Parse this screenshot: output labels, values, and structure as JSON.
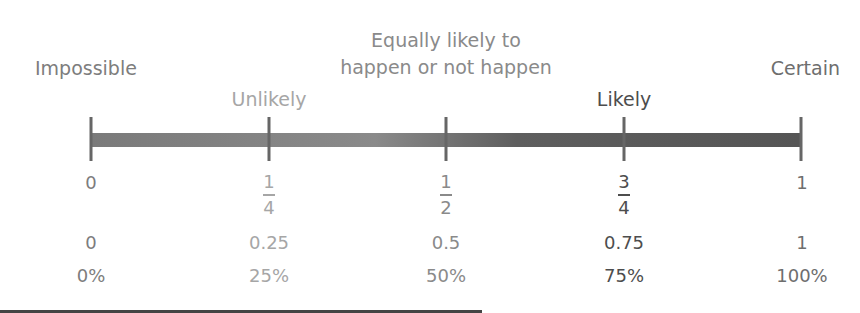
{
  "colors": {
    "impossible": "#7d7d7d",
    "unlikely": "#a6a6a6",
    "equal": "#8a8a8a",
    "likely": "#4d4d4d",
    "certain": "#6e6e6e"
  },
  "labels": {
    "impossible": "Impossible",
    "equal_line1": "Equally likely to",
    "equal_line2": "happen or not happen",
    "certain": "Certain",
    "unlikely": "Unlikely",
    "likely": "Likely"
  },
  "scale": {
    "points": [
      {
        "fraction_num": "0",
        "fraction_den": "",
        "decimal": "0",
        "percent": "0%"
      },
      {
        "fraction_num": "1",
        "fraction_den": "4",
        "decimal": "0.25",
        "percent": "25%"
      },
      {
        "fraction_num": "1",
        "fraction_den": "2",
        "decimal": "0.5",
        "percent": "50%"
      },
      {
        "fraction_num": "3",
        "fraction_den": "4",
        "decimal": "0.75",
        "percent": "75%"
      },
      {
        "fraction_num": "1",
        "fraction_den": "",
        "decimal": "1",
        "percent": "100%"
      }
    ]
  }
}
